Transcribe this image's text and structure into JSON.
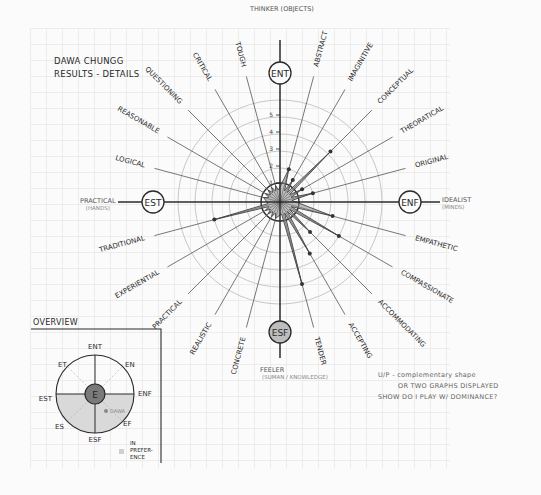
{
  "title": {
    "line1": "DAWA CHUNGG",
    "line2": "RESULTS - DETAILS"
  },
  "axes": {
    "top": {
      "type": "ENT",
      "label": "THINKER (OBJECTS)"
    },
    "right": {
      "type": "ENF",
      "label": "IDEALIST",
      "sublabel": "(MINDS)"
    },
    "bottom": {
      "type": "ESF",
      "label": "FEELER",
      "sublabel": "(SUMAN / KNOWLEDGE)"
    },
    "left": {
      "type": "EST",
      "label": "PRACTICAL",
      "sublabel": "(HANDS)"
    }
  },
  "scale_ticks": [
    "1",
    "2",
    "3",
    "4",
    "5"
  ],
  "chart_data": {
    "type": "radar",
    "title": "Dawa Chungg Results - Details",
    "range": [
      0,
      6
    ],
    "rings": 6,
    "quadrant_poles": [
      "ENT",
      "ENF",
      "ESF",
      "EST"
    ],
    "categories": [
      "Abstract",
      "Imaginative",
      "Conceptual",
      "Theoretical",
      "Original",
      "Empathetic",
      "Compassionate",
      "Accommodating",
      "Accepting",
      "Tender",
      "Concrete",
      "Realistic",
      "Practical",
      "Experiential",
      "Traditional",
      "Logical",
      "Reasonable",
      "Questioning",
      "Critical",
      "Tough"
    ],
    "values": [
      2,
      1.5,
      4.2,
      1.5,
      2,
      3.2,
      4,
      2.5,
      3.5,
      5,
      1,
      1,
      1,
      1,
      4,
      1,
      1,
      1,
      1,
      1
    ],
    "legend": []
  },
  "traits": [
    {
      "label": "ABSTRACT"
    },
    {
      "label": "IMAGINITIVE"
    },
    {
      "label": "CONCEPTUAL"
    },
    {
      "label": "THEORATICAL"
    },
    {
      "label": "ORIGINAL"
    },
    {
      "label": "EMPATHETIC"
    },
    {
      "label": "COMPASSIONATE"
    },
    {
      "label": "ACCOMMODATING"
    },
    {
      "label": "ACCEPTING"
    },
    {
      "label": "TENDER"
    },
    {
      "label": "CONCRETE"
    },
    {
      "label": "REALISTIC"
    },
    {
      "label": "PRACTICAL"
    },
    {
      "label": "EXPERIENTIAL"
    },
    {
      "label": "TRADITIONAL"
    },
    {
      "label": "LOGICAL"
    },
    {
      "label": "REASONABLE"
    },
    {
      "label": "QUESTIONING"
    },
    {
      "label": "CRITICAL"
    },
    {
      "label": "TOUGH"
    }
  ],
  "overview": {
    "title": "OVERVIEW",
    "center": "E",
    "labels": {
      "n": "ENT",
      "ne": "EN",
      "e": "ENF",
      "se": "EF",
      "s": "ESF",
      "sw": "ES",
      "w": "EST",
      "nw": "ET"
    },
    "marker_label": "DAWA",
    "legend_preference": "IN PREFER-ENCE"
  },
  "note": {
    "line1": "U/P - complementary shape",
    "line2": "OR TWO GRAPHS DISPLAYED",
    "line3": "SHOW DO I PLAY W/ DOMINANCE?"
  },
  "colors": {
    "ink": "#2a2a2a",
    "shape_fill": "#8a8a8a",
    "ring": "#c8c8c8",
    "grid": "#ececec"
  }
}
